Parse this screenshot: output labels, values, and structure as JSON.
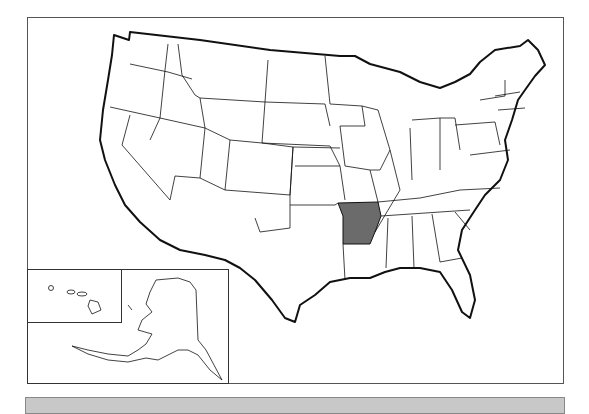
{
  "map": {
    "title": "United States",
    "highlighted_state": "Arkansas",
    "highlight_color": "#6b6b6b",
    "fill_color": "#ffffff",
    "stroke_color": "#111111",
    "insets": [
      "Alaska",
      "Hawaii"
    ]
  },
  "bottom_bar": {
    "color": "#c8c8c8",
    "label": ""
  }
}
